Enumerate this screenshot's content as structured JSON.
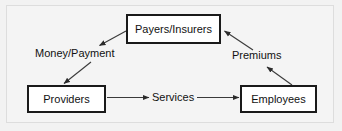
{
  "diagram": {
    "background_color": "#f2f2f2",
    "frame_color": "#dddddd",
    "node_fill": "#ffffff",
    "node_border": "#1a1a1a",
    "edge_color": "#3a3a3a",
    "text_color": "#111111",
    "nodes": [
      {
        "id": "payers",
        "label": "Payers/Insurers"
      },
      {
        "id": "providers",
        "label": "Providers"
      },
      {
        "id": "employees",
        "label": "Employees"
      }
    ],
    "edge_labels": [
      {
        "id": "money",
        "label": "Money/Payment"
      },
      {
        "id": "premiums",
        "label": "Premiums"
      },
      {
        "id": "services",
        "label": "Services"
      }
    ],
    "edges": [
      {
        "from": "payers",
        "to": "providers",
        "label": "Money/Payment",
        "style": "diagonal-arrow-down-left"
      },
      {
        "from": "providers",
        "to": "employees",
        "label": "Services",
        "style": "horizontal-arrow-right"
      },
      {
        "from": "employees",
        "to": "payers",
        "label": "Premiums",
        "style": "diagonal-arrow-up-left"
      }
    ]
  }
}
